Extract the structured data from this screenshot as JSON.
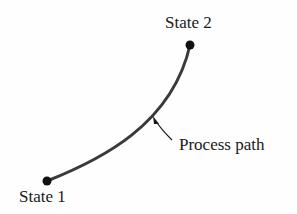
{
  "diagram": {
    "labels": {
      "state1": "State 1",
      "state2": "State 2",
      "process_path": "Process path"
    },
    "colors": {
      "line": "#3a3a3a",
      "dot": "#111111",
      "text": "#1a1a1a"
    },
    "nodes": [
      {
        "id": "state1",
        "x": 47,
        "y": 181
      },
      {
        "id": "state2",
        "x": 190,
        "y": 45
      }
    ]
  }
}
